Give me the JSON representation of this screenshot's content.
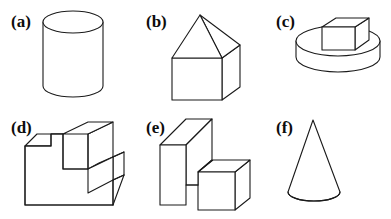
{
  "figure": {
    "background_color": "#ffffff",
    "stroke_color": "#1a1a1a",
    "fill_color": "#ffffff",
    "width": 391,
    "height": 219
  },
  "panels": [
    {
      "id": "a",
      "label": "(a)",
      "shape_name": "cylinder",
      "description": "Upright circular cylinder",
      "label_x": 11,
      "label_y": 27
    },
    {
      "id": "b",
      "label": "(b)",
      "shape_name": "cube-with-pyramid-roof",
      "description": "Cube topped by a square pyramid, house shape",
      "label_x": 146,
      "label_y": 27
    },
    {
      "id": "c",
      "label": "(c)",
      "shape_name": "cube-on-disc",
      "description": "Small cube resting on a flat circular disc",
      "label_x": 276,
      "label_y": 27
    },
    {
      "id": "d",
      "label": "(d)",
      "shape_name": "stepped-block",
      "description": "L-shaped stepped rectangular solid",
      "label_x": 11,
      "label_y": 133
    },
    {
      "id": "e",
      "label": "(e)",
      "shape_name": "slab-with-projecting-box",
      "description": "Upright slab with a rectangular box projecting to the right",
      "label_x": 146,
      "label_y": 133
    },
    {
      "id": "f",
      "label": "(f)",
      "shape_name": "cone",
      "description": "Upright circular cone",
      "label_x": 276,
      "label_y": 133
    }
  ]
}
